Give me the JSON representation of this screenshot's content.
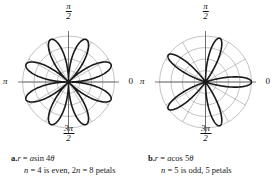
{
  "figure": {
    "title": "",
    "background": "#ffffff",
    "curve_color": "#1a1a1a",
    "grid_color": "#9a9a9a",
    "axis_color": "#555555"
  },
  "panels": [
    {
      "id": "panel-a",
      "label": "a.",
      "axis_labels": {
        "top_num": "π",
        "top_den": "2",
        "left": "π",
        "right": "0",
        "bottom_num": "3π",
        "bottom_den": "2"
      },
      "equation_prefix": "r",
      "equation_eq": "=",
      "equation_coef": "a",
      "equation_fn": "sin 4",
      "equation_theta": "θ",
      "note_n": "n",
      "note_text": " = 4 is even, 2",
      "note_n2": "n",
      "note_text2": " = 8 petals",
      "caption_line1": "a. r = a sin 4θ",
      "caption_line2": "n = 4 is even, 2n = 8 petals"
    },
    {
      "id": "panel-b",
      "label": "b.",
      "axis_labels": {
        "top_num": "π",
        "top_den": "2",
        "left": "π",
        "right": "0",
        "bottom_num": "3π",
        "bottom_den": "2"
      },
      "equation_prefix": "r",
      "equation_eq": "=",
      "equation_coef": "a",
      "equation_fn": "cos 5",
      "equation_theta": "θ",
      "note_n": "n",
      "note_text": " = 5 is odd, 5 petals",
      "note_n2": "",
      "note_text2": "",
      "caption_line1": "b. r = a cos 5θ",
      "caption_line2": "n = 5 is odd, 5 petals"
    }
  ],
  "chart_data": [
    {
      "type": "line",
      "subtype": "polar-rose",
      "title": "r = a sin 4θ",
      "equation": "r = a sin(4θ)",
      "n": 4,
      "petals": 8,
      "parity": "even",
      "amplitude": 1.0,
      "theta_range_deg": [
        0,
        360
      ],
      "petal_peak_angles_deg": [
        22.5,
        67.5,
        112.5,
        157.5,
        202.5,
        247.5,
        292.5,
        337.5
      ],
      "grid": {
        "rings": [
          0.25,
          0.5,
          0.75,
          1.0
        ],
        "ring_count": 4,
        "spoke_interval_deg": 30,
        "spoke_count": 12,
        "show": true
      },
      "axis_tick_labels": [
        "0",
        "π/2",
        "π",
        "3π/2"
      ],
      "xlabel": "",
      "ylabel": "",
      "legend": "none"
    },
    {
      "type": "line",
      "subtype": "polar-rose",
      "title": "r = a cos 5θ",
      "equation": "r = a cos(5θ)",
      "n": 5,
      "petals": 5,
      "parity": "odd",
      "amplitude": 1.0,
      "theta_range_deg": [
        0,
        360
      ],
      "petal_peak_angles_deg": [
        0,
        72,
        144,
        216,
        288
      ],
      "grid": {
        "rings": [
          0.25,
          0.5,
          0.75,
          1.0
        ],
        "ring_count": 4,
        "spoke_interval_deg": 30,
        "spoke_count": 12,
        "show": true
      },
      "axis_tick_labels": [
        "0",
        "π/2",
        "π",
        "3π/2"
      ],
      "xlabel": "",
      "ylabel": "",
      "legend": "none"
    }
  ]
}
